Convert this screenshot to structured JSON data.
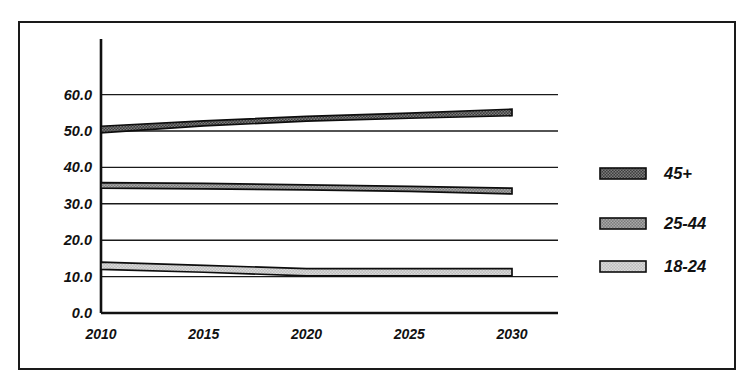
{
  "figure": {
    "background_color": "#ffffff",
    "frame_color": "#1a1a1a",
    "ink_color": "#111111"
  },
  "chart_data": {
    "type": "area",
    "title": "",
    "subtitle": "",
    "xlabel": "",
    "ylabel": "",
    "x": [
      2010,
      2015,
      2020,
      2025,
      2030
    ],
    "xtick_labels": [
      "2010",
      "2015",
      "2020",
      "2025",
      "2030"
    ],
    "ytick_labels": [
      "0.0",
      "10.0",
      "20.0",
      "30.0",
      "40.0",
      "50.0",
      "60.0"
    ],
    "ytick_values": [
      0.0,
      10.0,
      20.0,
      30.0,
      40.0,
      50.0,
      60.0
    ],
    "ylim": [
      0.0,
      65.0
    ],
    "xlim": [
      2010,
      2032
    ],
    "grid": true,
    "grid_axis": "y",
    "legend_position": "right",
    "series": [
      {
        "name": "45+",
        "fill_color": "#5b5b5b",
        "pattern": "dense-dot-dark",
        "upper": [
          51.3,
          52.8,
          54.0,
          54.9,
          56.0
        ],
        "lower": [
          49.5,
          51.4,
          52.7,
          53.5,
          54.2
        ],
        "center": [
          50.4,
          52.1,
          53.35,
          54.2,
          55.1
        ]
      },
      {
        "name": "25-44",
        "fill_color": "#8f8f8f",
        "pattern": "dense-dot-medium",
        "upper": [
          35.8,
          35.6,
          35.2,
          34.8,
          34.3
        ],
        "lower": [
          34.3,
          34.1,
          33.8,
          33.4,
          32.7
        ],
        "center": [
          35.05,
          34.85,
          34.5,
          34.1,
          33.5
        ]
      },
      {
        "name": "18-24",
        "fill_color": "#c6c6c6",
        "pattern": "dense-dot-light",
        "upper": [
          14.0,
          13.1,
          12.2,
          12.2,
          12.2
        ],
        "lower": [
          12.0,
          11.2,
          10.2,
          10.2,
          10.2
        ],
        "center": [
          13.0,
          12.15,
          11.2,
          11.2,
          11.2
        ]
      }
    ]
  },
  "legend": {
    "items": [
      {
        "label": "45+",
        "swatch": "swatch-45-plus"
      },
      {
        "label": "25-44",
        "swatch": "swatch-25-44"
      },
      {
        "label": "18-24",
        "swatch": "swatch-18-24"
      }
    ]
  }
}
